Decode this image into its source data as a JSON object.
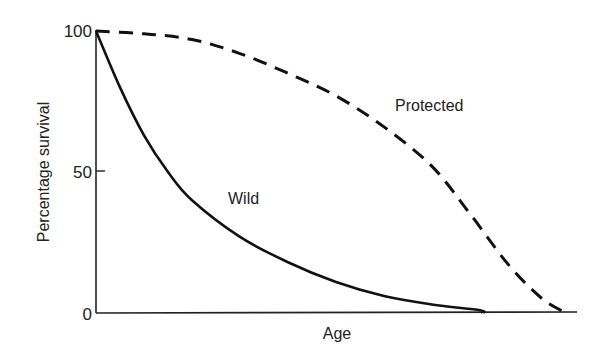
{
  "chart_data": {
    "type": "line",
    "title": "",
    "xlabel": "Age",
    "ylabel": "Percentage survival",
    "ylim": [
      0,
      100
    ],
    "xlim": [
      0,
      100
    ],
    "yticks": [
      "0",
      "50",
      "100"
    ],
    "xticks": [],
    "grid": false,
    "legend": "inline labels",
    "x": [
      0,
      10,
      20,
      30,
      40,
      50,
      60,
      70,
      80,
      90,
      95,
      100
    ],
    "series": [
      {
        "name": "Protected",
        "style": "dashed",
        "label_text": "Protected",
        "points": [
          [
            0,
            100
          ],
          [
            10,
            99
          ],
          [
            20,
            97
          ],
          [
            30,
            92
          ],
          [
            40,
            85
          ],
          [
            50,
            77
          ],
          [
            60,
            66
          ],
          [
            70,
            52
          ],
          [
            78,
            35
          ],
          [
            86,
            17
          ],
          [
            93,
            5
          ],
          [
            98,
            0
          ]
        ]
      },
      {
        "name": "Wild",
        "style": "solid",
        "label_text": "Wild",
        "points": [
          [
            0,
            100
          ],
          [
            5,
            80
          ],
          [
            10,
            63
          ],
          [
            15,
            50
          ],
          [
            20,
            40
          ],
          [
            30,
            27
          ],
          [
            40,
            18
          ],
          [
            50,
            11
          ],
          [
            60,
            6
          ],
          [
            70,
            3
          ],
          [
            80,
            1
          ],
          [
            80.5,
            0
          ]
        ]
      }
    ],
    "colors": {
      "line": "#111111",
      "axis": "#222222",
      "text": "#222222"
    }
  }
}
